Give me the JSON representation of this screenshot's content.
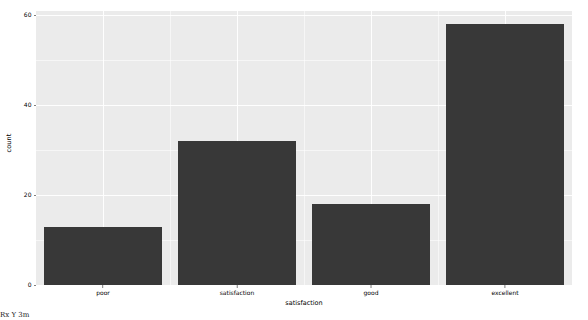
{
  "chart_data": {
    "type": "bar",
    "title": "",
    "subtitle": "",
    "categories": [
      "poor",
      "satisfaction",
      "good",
      "excellent"
    ],
    "values": [
      13,
      32,
      18,
      58
    ],
    "series": [
      {
        "name": "count",
        "values": [
          13,
          32,
          18,
          58
        ]
      }
    ],
    "xlabel": "satisfaction",
    "ylabel": "count",
    "ylim": [
      0,
      61
    ],
    "xlim": [
      0,
      4
    ],
    "y_ticks": [
      0,
      20,
      40,
      60
    ],
    "y_tick_labels": [
      "0",
      "20",
      "40",
      "60"
    ],
    "y_minor_ticks": [
      10,
      30,
      50
    ],
    "grid": true,
    "legend": false,
    "legend_position": "none",
    "bar_color": "#383838",
    "panel_color": "#ebebeb",
    "grid_color": "#ffffff",
    "axis_text_color": "#000000",
    "bar_width_ratio": 0.88
  },
  "axis": {
    "y_title": "count",
    "x_title": "satisfaction"
  },
  "artifact": {
    "bottom_left_text": "Rx Y 3m"
  }
}
